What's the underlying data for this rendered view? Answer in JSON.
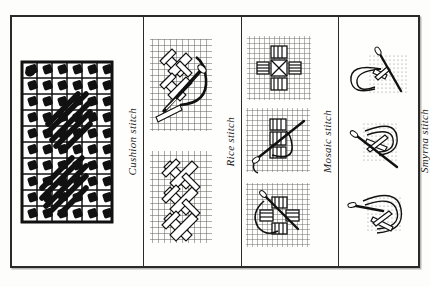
{
  "plate": {
    "title": "Canvas embroidery stitch diagram plate",
    "border_color": "#2a2a2a",
    "background_color": "#fefefd",
    "ink_color": "#1a1a1a",
    "grid_color": "#6f6f6f"
  },
  "panels": [
    {
      "id": "cushion",
      "label": "Cushion stitch",
      "figure_count": 1,
      "figures": [
        {
          "name": "worked-sampler",
          "description": "Finished square canvas sampler of cushion stitch blocks with diagonal stitches",
          "grid_cols": 6,
          "grid_rows": 10,
          "style": "solid-black-on-white"
        }
      ]
    },
    {
      "id": "rice",
      "label": "Rice stitch",
      "figure_count": 2,
      "figures": [
        {
          "name": "needle-working-step",
          "description": "Needle and thread crossing over large cross stitches on canvas grid"
        },
        {
          "name": "completed-row",
          "description": "Vertical column of completed rice cross stitches on canvas grid"
        }
      ]
    },
    {
      "id": "mosaic",
      "label": "Mosaic stitch",
      "figure_count": 3,
      "figures": [
        {
          "name": "completed-motif",
          "description": "Finished mosaic stitch cross motif of four blocks around a centre"
        },
        {
          "name": "needle-step-one",
          "description": "Needle entering canvas with thread loop forming mosaic blocks"
        },
        {
          "name": "needle-step-two",
          "description": "Needle drawing thread through to complete mosaic block"
        }
      ]
    },
    {
      "id": "smyrna",
      "label": "Smyrna stitch",
      "figure_count": 3,
      "figures": [
        {
          "name": "needle-step-one",
          "description": "Needle with looping thread beginning a Smyrna cross on dotted canvas"
        },
        {
          "name": "needle-step-two",
          "description": "Needle laying the upright cross over the diagonal cross"
        },
        {
          "name": "needle-step-three",
          "description": "Needle completing the Smyrna double cross stitch"
        }
      ]
    }
  ]
}
